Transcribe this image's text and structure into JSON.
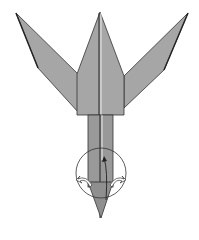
{
  "diagram": {
    "type": "origami-folding-step",
    "colors": {
      "paper": "#a6a6a6",
      "paper_dark": "#8f8f8f",
      "outline": "#333333",
      "background": "#ffffff",
      "arrow_fill": "#ffffff"
    },
    "elements": [
      "left-wing-flap",
      "right-wing-flap",
      "center-point-flap",
      "body",
      "stem",
      "bottom-point",
      "focus-circle",
      "left-turn-arrow",
      "right-turn-arrow",
      "valley-fold-arrow"
    ]
  }
}
